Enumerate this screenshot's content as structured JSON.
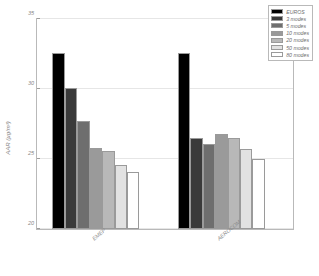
{
  "chart_data": {
    "type": "bar",
    "title": "",
    "xlabel": "",
    "ylabel": "AAR (µg/m³)",
    "ylim": [
      20,
      35
    ],
    "yticks": [
      20,
      25,
      30,
      35
    ],
    "grid": false,
    "categories": [
      "EMEP",
      "AEROCOM"
    ],
    "legend_position": "top-right",
    "series": [
      {
        "name": "EUROS",
        "color": "#000000",
        "values": [
          32.6,
          32.6
        ]
      },
      {
        "name": "3 modes",
        "color": "#3a3a3a",
        "values": [
          30.1,
          26.5
        ]
      },
      {
        "name": "5 modes",
        "color": "#6e6e6e",
        "values": [
          27.7,
          26.1
        ]
      },
      {
        "name": "10 modes",
        "color": "#9a9a9a",
        "values": [
          25.8,
          26.8
        ]
      },
      {
        "name": "20 modes",
        "color": "#b8b8b8",
        "values": [
          25.6,
          26.5
        ]
      },
      {
        "name": "50 modes",
        "color": "#e2e2e2",
        "values": [
          24.6,
          25.7
        ]
      },
      {
        "name": "80 modes",
        "color": "#ffffff",
        "values": [
          24.1,
          25.0
        ]
      }
    ]
  },
  "legend": {
    "items": [
      {
        "label": "EUROS"
      },
      {
        "label": "3 modes"
      },
      {
        "label": "5 modes"
      },
      {
        "label": "10 modes"
      },
      {
        "label": "20 modes"
      },
      {
        "label": "50 modes"
      },
      {
        "label": "80 modes"
      }
    ]
  },
  "axes": {
    "y_tick_labels": [
      "20",
      "25",
      "30",
      "35"
    ],
    "y_title": "AAR (µg/m³)",
    "x_tick_labels": [
      "EMEP",
      "AEROCOM"
    ]
  }
}
